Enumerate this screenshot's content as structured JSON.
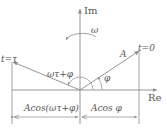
{
  "diagram": {
    "type": "phasor-diagram",
    "axes": {
      "imaginary_label": "Im",
      "real_label": "Re"
    },
    "rotation_label": "ω",
    "phasor_label": "A",
    "start_label": "t=0",
    "end_label": "t=τ",
    "initial_angle_label": "φ",
    "rotated_angle_label": "ωτ+φ",
    "projection_left_label": "Acos(ωτ+φ)",
    "projection_right_label": "Acos φ",
    "colors": {
      "lines": "#8a8a8a",
      "text": "#555555",
      "background": "#ffffff"
    }
  }
}
